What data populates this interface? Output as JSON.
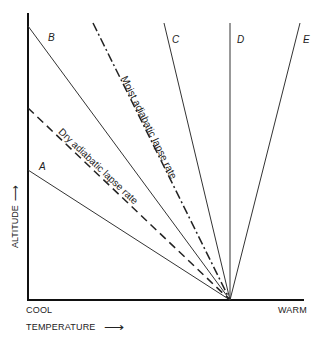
{
  "diagram": {
    "axes": {
      "y_label": "ALTITUDE",
      "x_label": "TEMPERATURE",
      "x_min_label": "COOL",
      "x_max_label": "WARM",
      "arrow": "⟶"
    },
    "lines": [
      {
        "id": "A",
        "label": "A",
        "style": "solid"
      },
      {
        "id": "dry",
        "label": "Dry adiabatic lapse rate",
        "style": "dashed"
      },
      {
        "id": "B",
        "label": "B",
        "style": "solid"
      },
      {
        "id": "moist",
        "label": "Moist adiabatic lapse rate",
        "style": "dash-dot"
      },
      {
        "id": "C",
        "label": "C",
        "style": "solid"
      },
      {
        "id": "D",
        "label": "D",
        "style": "solid"
      },
      {
        "id": "E",
        "label": "E",
        "style": "solid"
      }
    ],
    "colors": {
      "line": "#222222",
      "background": "#ffffff"
    }
  }
}
